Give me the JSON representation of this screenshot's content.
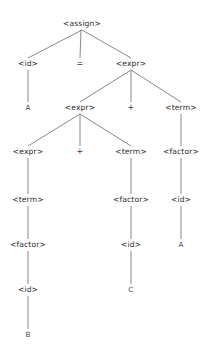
{
  "diagram": {
    "width": 208,
    "height": 350,
    "background_color": "#ffffff",
    "edge_color": "#7a7a7a",
    "text_color": "#2e2e2e"
  },
  "nodes": [
    {
      "id": "n0",
      "label": "<assign>",
      "kind": "nonterminal",
      "x": 82,
      "y": 24,
      "level": 1
    },
    {
      "id": "n1",
      "label": "<id>",
      "kind": "nonterminal",
      "x": 28,
      "y": 64,
      "level": 2
    },
    {
      "id": "n2",
      "label": "=",
      "kind": "operator",
      "x": 80,
      "y": 64,
      "level": 2
    },
    {
      "id": "n3",
      "label": "<expr>",
      "kind": "nonterminal",
      "x": 131,
      "y": 64,
      "level": 2
    },
    {
      "id": "n4",
      "label": "A",
      "kind": "terminal",
      "x": 28,
      "y": 108,
      "level": 3
    },
    {
      "id": "n5",
      "label": "<expr>",
      "kind": "nonterminal",
      "x": 80,
      "y": 108,
      "level": 3
    },
    {
      "id": "n6",
      "label": "+",
      "kind": "operator",
      "x": 131,
      "y": 108,
      "level": 3
    },
    {
      "id": "n7",
      "label": "<term>",
      "kind": "nonterminal",
      "x": 181,
      "y": 108,
      "level": 3
    },
    {
      "id": "n8",
      "label": "<expr>",
      "kind": "nonterminal",
      "x": 28,
      "y": 152,
      "level": 4
    },
    {
      "id": "n9",
      "label": "+",
      "kind": "operator",
      "x": 80,
      "y": 152,
      "level": 4
    },
    {
      "id": "n10",
      "label": "<term>",
      "kind": "nonterminal",
      "x": 131,
      "y": 152,
      "level": 4
    },
    {
      "id": "n11",
      "label": "<factor>",
      "kind": "nonterminal",
      "x": 181,
      "y": 152,
      "level": 4
    },
    {
      "id": "n12",
      "label": "<term>",
      "kind": "nonterminal",
      "x": 28,
      "y": 200,
      "level": 5
    },
    {
      "id": "n13",
      "label": "<factor>",
      "kind": "nonterminal",
      "x": 131,
      "y": 200,
      "level": 5
    },
    {
      "id": "n14",
      "label": "<id>",
      "kind": "nonterminal",
      "x": 181,
      "y": 200,
      "level": 5
    },
    {
      "id": "n15",
      "label": "<factor>",
      "kind": "nonterminal",
      "x": 28,
      "y": 245,
      "level": 6
    },
    {
      "id": "n16",
      "label": "<id>",
      "kind": "nonterminal",
      "x": 131,
      "y": 245,
      "level": 6
    },
    {
      "id": "n17",
      "label": "A",
      "kind": "terminal",
      "x": 181,
      "y": 245,
      "level": 6
    },
    {
      "id": "n18",
      "label": "<id>",
      "kind": "nonterminal",
      "x": 28,
      "y": 290,
      "level": 7
    },
    {
      "id": "n19",
      "label": "C",
      "kind": "terminal",
      "x": 131,
      "y": 290,
      "level": 7
    },
    {
      "id": "n20",
      "label": "B",
      "kind": "terminal",
      "x": 28,
      "y": 335,
      "level": 8
    }
  ],
  "edges": [
    {
      "from": "n0",
      "to": "n1",
      "x1": 82,
      "y1": 30,
      "x2": 28,
      "y2": 58
    },
    {
      "from": "n0",
      "to": "n2",
      "x1": 81,
      "y1": 30,
      "x2": 80,
      "y2": 58
    },
    {
      "from": "n0",
      "to": "n3",
      "x1": 82,
      "y1": 30,
      "x2": 131,
      "y2": 58
    },
    {
      "from": "n1",
      "to": "n4",
      "x1": 28,
      "y1": 70,
      "x2": 28,
      "y2": 102
    },
    {
      "from": "n3",
      "to": "n5",
      "x1": 131,
      "y1": 70,
      "x2": 80,
      "y2": 102
    },
    {
      "from": "n3",
      "to": "n6",
      "x1": 131,
      "y1": 70,
      "x2": 131,
      "y2": 102
    },
    {
      "from": "n3",
      "to": "n7",
      "x1": 131,
      "y1": 70,
      "x2": 181,
      "y2": 102
    },
    {
      "from": "n5",
      "to": "n8",
      "x1": 80,
      "y1": 114,
      "x2": 28,
      "y2": 146
    },
    {
      "from": "n5",
      "to": "n9",
      "x1": 80,
      "y1": 114,
      "x2": 80,
      "y2": 146
    },
    {
      "from": "n5",
      "to": "n10",
      "x1": 80,
      "y1": 114,
      "x2": 131,
      "y2": 146
    },
    {
      "from": "n7",
      "to": "n11",
      "x1": 181,
      "y1": 114,
      "x2": 181,
      "y2": 146
    },
    {
      "from": "n8",
      "to": "n12",
      "x1": 28,
      "y1": 158,
      "x2": 28,
      "y2": 194
    },
    {
      "from": "n10",
      "to": "n13",
      "x1": 131,
      "y1": 158,
      "x2": 131,
      "y2": 194
    },
    {
      "from": "n11",
      "to": "n14",
      "x1": 181,
      "y1": 158,
      "x2": 181,
      "y2": 194
    },
    {
      "from": "n12",
      "to": "n15",
      "x1": 28,
      "y1": 206,
      "x2": 28,
      "y2": 239
    },
    {
      "from": "n13",
      "to": "n16",
      "x1": 131,
      "y1": 206,
      "x2": 131,
      "y2": 239
    },
    {
      "from": "n14",
      "to": "n17",
      "x1": 181,
      "y1": 206,
      "x2": 181,
      "y2": 239
    },
    {
      "from": "n15",
      "to": "n18",
      "x1": 28,
      "y1": 251,
      "x2": 28,
      "y2": 284
    },
    {
      "from": "n16",
      "to": "n19",
      "x1": 131,
      "y1": 251,
      "x2": 131,
      "y2": 284
    },
    {
      "from": "n18",
      "to": "n20",
      "x1": 28,
      "y1": 296,
      "x2": 28,
      "y2": 329
    }
  ]
}
